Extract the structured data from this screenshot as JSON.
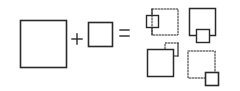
{
  "diagram": {
    "colors": {
      "stroke": "#2a2a2a",
      "background": "#ffffff"
    },
    "equation": {
      "left_operand": "large-square",
      "operator_plus": "+",
      "right_operand": "small-square",
      "operator_equals": "="
    },
    "results": [
      {
        "name": "arrangement-1",
        "large_square": "dotted",
        "small_square": "solid",
        "small_position": "left-side"
      },
      {
        "name": "arrangement-2",
        "large_square": "solid",
        "small_square": "solid",
        "small_position": "bottom-side"
      },
      {
        "name": "arrangement-3",
        "large_square": "solid",
        "small_square": "dotted",
        "small_position": "top-right-corner"
      },
      {
        "name": "arrangement-4",
        "large_square": "dotted",
        "small_square": "solid",
        "small_position": "bottom-right-corner"
      }
    ]
  }
}
